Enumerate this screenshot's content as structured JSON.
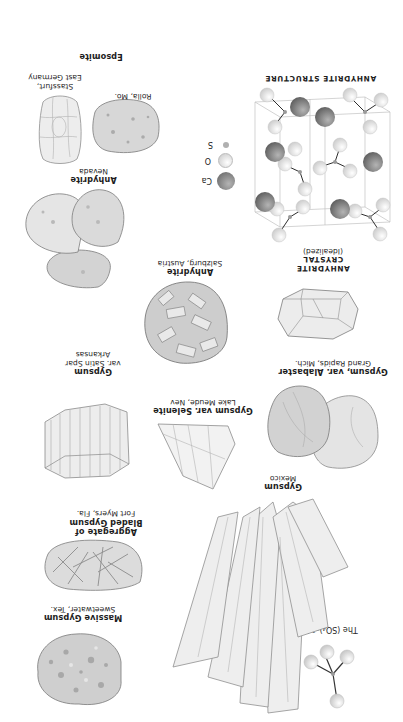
{
  "page": {
    "orientation": "rotated-180",
    "background": "#ffffff"
  },
  "ion": {
    "label": "The (SO₄)⁻² Ion"
  },
  "specimens": [
    {
      "id": "massive-gypsum",
      "name": "Massive Gypsum",
      "locality": "Sweetwater, Tex."
    },
    {
      "id": "bladed-gypsum",
      "name": "Aggregate of Bladed Gypsum",
      "name_line1": "Aggregate of",
      "name_line2": "Bladed Gypsum",
      "locality": "Fort Myers, Fla."
    },
    {
      "id": "gypsum-mexico",
      "name": "Gypsum",
      "locality": "Mexico"
    },
    {
      "id": "selenite",
      "name": "Gypsum var. Selenite",
      "locality": "Lake Meude, Nev"
    },
    {
      "id": "satin-spar",
      "name": "Gypsum",
      "name_line2": "var. Satin Spar",
      "locality": "Arkansas"
    },
    {
      "id": "alabaster",
      "name": "Gypsum, var. Alabaster",
      "locality": "Grand Rapids, Mich."
    },
    {
      "id": "anhydrite-salzburg",
      "name": "Anhydrite",
      "locality": "Salzburg, Austria"
    },
    {
      "id": "anhydrite-nevada",
      "name": "Anhydrite",
      "locality": "Nevada"
    },
    {
      "id": "anhydrite-rolla",
      "name": "",
      "locality": "Rolla, Mo."
    },
    {
      "id": "epsomite",
      "name": "Epsomite",
      "locality_line1": "Stassfurt,",
      "locality_line2": "East Germany"
    }
  ],
  "crystal": {
    "line1": "ANHYDRITE",
    "line2": "CRYSTAL",
    "line3": "(Idealized)"
  },
  "structure": {
    "title": "ANHYDRITE STRUCTURE",
    "legend": [
      {
        "symbol": "Ca",
        "color": "#8a8a8a",
        "size": "large"
      },
      {
        "symbol": "O",
        "color": "#e6e6e6",
        "size": "medium"
      },
      {
        "symbol": "S",
        "color": "#b5b5b5",
        "size": "small"
      }
    ]
  }
}
